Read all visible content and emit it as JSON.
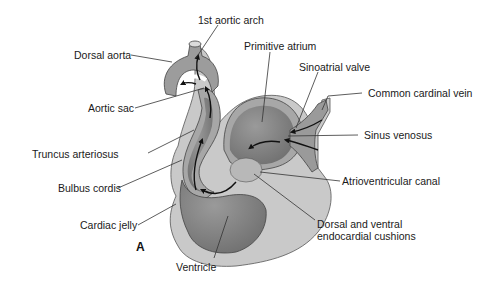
{
  "figure": {
    "panel_letter": "A",
    "colors": {
      "background": "#ffffff",
      "cardiac_jelly": "#c9c9c9",
      "myocardium_outer": "#a7a7a7",
      "lumen": "#8c8c8c",
      "lumen_dark": "#6a6a6a",
      "cushion": "#b8b8b8",
      "line": "#333333",
      "text": "#1a1a1a"
    }
  },
  "labels": {
    "first_aortic_arch": "1st aortic arch",
    "dorsal_aorta": "Dorsal aorta",
    "primitive_atrium": "Primitive atrium",
    "sinoatrial_valve": "Sinoatrial valve",
    "common_cardinal_vein": "Common cardinal vein",
    "aortic_sac": "Aortic sac",
    "sinus_venosus": "Sinus venosus",
    "truncus_arteriosus": "Truncus arteriosus",
    "atrioventricular_canal": "Atrioventricular canal",
    "bulbus_cordis": "Bulbus cordis",
    "cardiac_jelly": "Cardiac jelly",
    "endocardial_cushions_line1": "Dorsal and ventral",
    "endocardial_cushions_line2": "endocardial cushions",
    "ventricle": "Ventricle"
  }
}
